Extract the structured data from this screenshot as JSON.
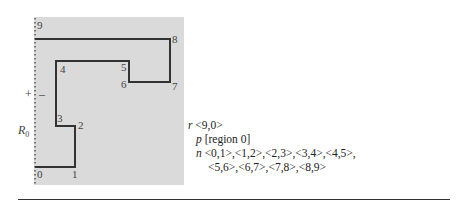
{
  "figure": {
    "panel_color": "#dadada",
    "path_color": "#333333",
    "vertices": [
      {
        "id": "0",
        "x": 35,
        "y": 167
      },
      {
        "id": "1",
        "x": 75,
        "y": 167
      },
      {
        "id": "2",
        "x": 75,
        "y": 126
      },
      {
        "id": "3",
        "x": 56,
        "y": 126
      },
      {
        "id": "4",
        "x": 56,
        "y": 61
      },
      {
        "id": "5",
        "x": 129,
        "y": 61
      },
      {
        "id": "6",
        "x": 129,
        "y": 82
      },
      {
        "id": "7",
        "x": 170,
        "y": 82
      },
      {
        "id": "8",
        "x": 170,
        "y": 39
      },
      {
        "id": "9",
        "x": 35,
        "y": 39
      }
    ],
    "labels": {
      "v0": "0",
      "v1": "1",
      "v2": "2",
      "v3": "3",
      "v4": "4",
      "v5": "5",
      "v6": "6",
      "v7": "7",
      "v8": "8",
      "v9": "9"
    },
    "side": {
      "plus": "+",
      "minus": "–",
      "region": "R",
      "region_sub": "0"
    }
  },
  "description": {
    "r_key": "r",
    "r_val": "<9,0>",
    "p_key": "p",
    "p_val": "[region 0]",
    "n_key": "n",
    "n_line1": "<0,1>,<1,2>,<2,3>,<3,4>,<4,5>,",
    "n_line2": "<5,6>,<6,7>,<7,8>,<8,9>"
  }
}
